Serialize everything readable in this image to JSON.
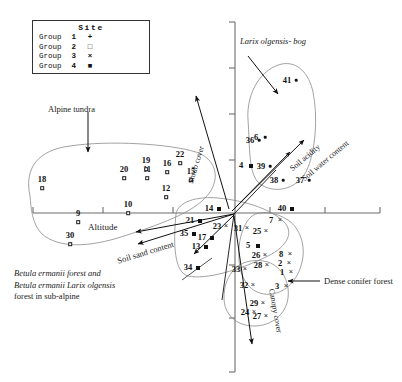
{
  "figure": {
    "type": "ordination-biplot",
    "axes": {
      "x_axis_label": "",
      "y_axis_label": "",
      "origin_px": [
        235,
        213
      ],
      "x_axis_extent_px": [
        33,
        380
      ],
      "y_axis_extent_px": [
        22,
        372
      ]
    }
  },
  "legend": {
    "title": "Site",
    "rows": [
      {
        "group_label": "Group",
        "number": "1",
        "symbol": "+",
        "marker": "dot-plus-icon"
      },
      {
        "group_label": "Group",
        "number": "2",
        "symbol": "□",
        "marker": "open-square-icon"
      },
      {
        "group_label": "Group",
        "number": "3",
        "symbol": "×",
        "marker": "cross-icon"
      },
      {
        "group_label": "Group",
        "number": "4",
        "symbol": "■",
        "marker": "filled-square-icon"
      }
    ]
  },
  "annotations": {
    "alpine_tundra": "Alpine tundra",
    "larix_bog": "Larix olgensis- bog",
    "dense_conifer": "Dense conifer forest",
    "betula_line1": "Betula ermanii forest and",
    "betula_line2": "Betula ermanii Larix olgensis",
    "betula_line3": "forest in sub-alpine"
  },
  "environmental_vectors": [
    {
      "name": "Shrub cover",
      "label": "Shrub cover"
    },
    {
      "name": "Soil acidity",
      "label": "Soil acidity"
    },
    {
      "name": "Soil water content",
      "label": "Soil water content"
    },
    {
      "name": "Altitude",
      "label": "Altitude"
    },
    {
      "name": "Soil sand content",
      "label": "Soil sand content"
    },
    {
      "name": "Canopy cover",
      "label": "Canopy cover"
    }
  ],
  "chart_data": {
    "type": "scatter",
    "title": "",
    "xlabel": "",
    "ylabel": "",
    "grid": false,
    "legend_position": "top-left",
    "series": [
      {
        "name": "Group 1",
        "marker": "dot",
        "points": [
          {
            "label": "41",
            "x": 296,
            "y": 80
          },
          {
            "label": "6",
            "x": 265,
            "y": 137
          },
          {
            "label": "36",
            "x": 259,
            "y": 140
          },
          {
            "label": "39",
            "x": 270,
            "y": 166
          },
          {
            "label": "37",
            "x": 309,
            "y": 180
          },
          {
            "label": "38",
            "x": 283,
            "y": 180
          }
        ]
      },
      {
        "name": "Group 2",
        "marker": "open-square",
        "points": [
          {
            "label": "18",
            "x": 42,
            "y": 188
          },
          {
            "label": "9",
            "x": 78,
            "y": 222
          },
          {
            "label": "30",
            "x": 70,
            "y": 244
          },
          {
            "label": "10",
            "x": 128,
            "y": 213
          },
          {
            "label": "11",
            "x": 147,
            "y": 178
          },
          {
            "label": "20",
            "x": 124,
            "y": 178
          },
          {
            "label": "19",
            "x": 146,
            "y": 169
          },
          {
            "label": "16",
            "x": 167,
            "y": 172
          },
          {
            "label": "22",
            "x": 180,
            "y": 163
          },
          {
            "label": "15",
            "x": 191,
            "y": 180
          },
          {
            "label": "12",
            "x": 166,
            "y": 197
          }
        ]
      },
      {
        "name": "Group 3",
        "marker": "cross",
        "points": [
          {
            "label": "7",
            "x": 280,
            "y": 220
          },
          {
            "label": "8",
            "x": 290,
            "y": 254
          },
          {
            "label": "2",
            "x": 289,
            "y": 263
          },
          {
            "label": "1",
            "x": 291,
            "y": 272
          },
          {
            "label": "3",
            "x": 286,
            "y": 286
          },
          {
            "label": "26",
            "x": 265,
            "y": 255
          },
          {
            "label": "28",
            "x": 267,
            "y": 265
          },
          {
            "label": "33",
            "x": 245,
            "y": 269
          },
          {
            "label": "32",
            "x": 253,
            "y": 285
          },
          {
            "label": "29",
            "x": 263,
            "y": 303
          },
          {
            "label": "24",
            "x": 254,
            "y": 312
          },
          {
            "label": "27",
            "x": 266,
            "y": 316
          },
          {
            "label": "31",
            "x": 247,
            "y": 228
          },
          {
            "label": "25",
            "x": 266,
            "y": 231
          },
          {
            "label": "23",
            "x": 226,
            "y": 226
          }
        ]
      },
      {
        "name": "Group 4",
        "marker": "filled-square",
        "points": [
          {
            "label": "4",
            "x": 251,
            "y": 166
          },
          {
            "label": "40",
            "x": 292,
            "y": 209
          },
          {
            "label": "14",
            "x": 219,
            "y": 209
          },
          {
            "label": "21",
            "x": 200,
            "y": 221
          },
          {
            "label": "35",
            "x": 194,
            "y": 234
          },
          {
            "label": "17",
            "x": 212,
            "y": 238
          },
          {
            "label": "13",
            "x": 206,
            "y": 247
          },
          {
            "label": "34",
            "x": 198,
            "y": 268
          },
          {
            "label": "5",
            "x": 258,
            "y": 246
          }
        ]
      }
    ]
  }
}
